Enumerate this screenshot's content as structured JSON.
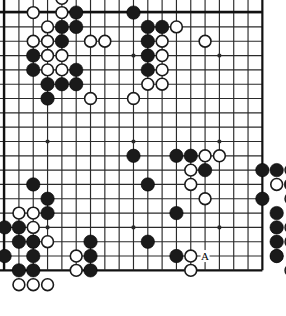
{
  "board": {
    "title": "Go board diagram",
    "size": 19,
    "geometry": {
      "origin_x": 4.6,
      "origin_y": 12.6,
      "spacing": 14.32,
      "stone_diameter": 13.4,
      "clip_left_cols": 1,
      "clip_top_rows": 1
    },
    "colors": {
      "background": "#ffffff",
      "line": "#2a2a2a",
      "edge_line": "#111111",
      "black_stone": "#1a1a1a",
      "white_stone": "#ffffff",
      "white_stone_border": "#1a1a1a",
      "label_text": "#000000"
    },
    "star_points": [
      [
        3,
        3
      ],
      [
        9,
        3
      ],
      [
        15,
        3
      ],
      [
        3,
        9
      ],
      [
        9,
        9
      ],
      [
        15,
        9
      ],
      [
        3,
        15
      ],
      [
        9,
        15
      ],
      [
        15,
        15
      ]
    ],
    "black_stones": [
      [
        5,
        0
      ],
      [
        9,
        0
      ],
      [
        4,
        1
      ],
      [
        5,
        1
      ],
      [
        10,
        1
      ],
      [
        11,
        1
      ],
      [
        4,
        2
      ],
      [
        10,
        2
      ],
      [
        2,
        3
      ],
      [
        10,
        3
      ],
      [
        2,
        4
      ],
      [
        5,
        4
      ],
      [
        10,
        4
      ],
      [
        3,
        5
      ],
      [
        4,
        5
      ],
      [
        5,
        5
      ],
      [
        3,
        6
      ],
      [
        9,
        10
      ],
      [
        12,
        10
      ],
      [
        13,
        10
      ],
      [
        14,
        11
      ],
      [
        18,
        11
      ],
      [
        19,
        11
      ],
      [
        2,
        12
      ],
      [
        10,
        12
      ],
      [
        20,
        12
      ],
      [
        3,
        13
      ],
      [
        18,
        13
      ],
      [
        3,
        14
      ],
      [
        12,
        14
      ],
      [
        19,
        14
      ],
      [
        0,
        15
      ],
      [
        1,
        15
      ],
      [
        19,
        15
      ],
      [
        1,
        16
      ],
      [
        2,
        16
      ],
      [
        6,
        16
      ],
      [
        10,
        16
      ],
      [
        19,
        16
      ],
      [
        0,
        17
      ],
      [
        2,
        17
      ],
      [
        6,
        17
      ],
      [
        12,
        17
      ],
      [
        19,
        17
      ],
      [
        1,
        18
      ],
      [
        2,
        18
      ],
      [
        6,
        18
      ]
    ],
    "white_stones": [
      [
        4,
        -1
      ],
      [
        2,
        0
      ],
      [
        4,
        0
      ],
      [
        3,
        1
      ],
      [
        12,
        1
      ],
      [
        2,
        2
      ],
      [
        3,
        2
      ],
      [
        6,
        2
      ],
      [
        7,
        2
      ],
      [
        11,
        2
      ],
      [
        14,
        2
      ],
      [
        3,
        3
      ],
      [
        4,
        3
      ],
      [
        11,
        3
      ],
      [
        3,
        4
      ],
      [
        4,
        4
      ],
      [
        11,
        4
      ],
      [
        10,
        5
      ],
      [
        11,
        5
      ],
      [
        6,
        6
      ],
      [
        9,
        6
      ],
      [
        14,
        10
      ],
      [
        15,
        10
      ],
      [
        13,
        11
      ],
      [
        20,
        11
      ],
      [
        13,
        12
      ],
      [
        19,
        12
      ],
      [
        21,
        12
      ],
      [
        14,
        13
      ],
      [
        20,
        13
      ],
      [
        21,
        13
      ],
      [
        1,
        14
      ],
      [
        2,
        14
      ],
      [
        -1,
        15
      ],
      [
        2,
        15
      ],
      [
        20,
        15
      ],
      [
        2,
        16
      ],
      [
        3,
        16
      ],
      [
        20,
        16
      ],
      [
        5,
        17
      ],
      [
        13,
        17
      ],
      [
        19,
        17
      ],
      [
        5,
        18
      ],
      [
        13,
        18
      ],
      [
        20,
        18
      ],
      [
        1,
        19
      ],
      [
        2,
        19
      ],
      [
        3,
        19
      ]
    ],
    "labels": [
      {
        "text": "A",
        "col": 14,
        "row": 17
      }
    ]
  }
}
